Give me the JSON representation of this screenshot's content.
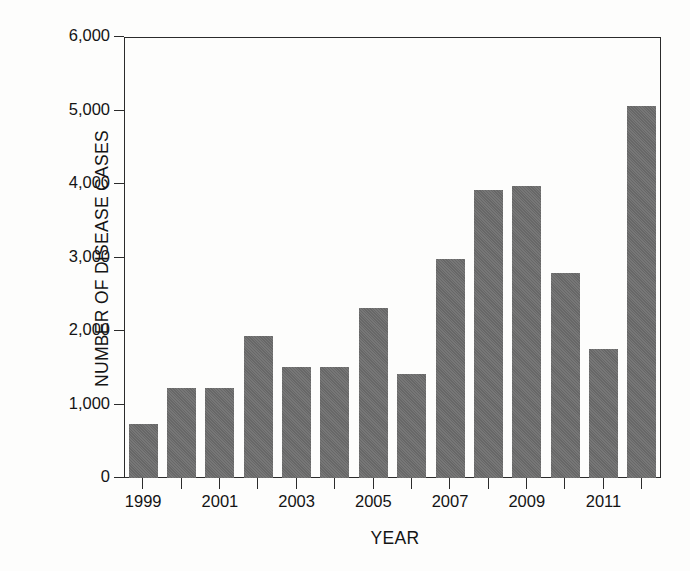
{
  "chart_data": {
    "type": "bar",
    "title": "",
    "xlabel": "YEAR",
    "ylabel": "NUMBER OF DISEASE CASES",
    "categories": [
      "1999",
      "2000",
      "2001",
      "2002",
      "2003",
      "2004",
      "2005",
      "2006",
      "2007",
      "2008",
      "2009",
      "2010",
      "2011",
      "2012"
    ],
    "values": [
      740,
      1220,
      1220,
      1930,
      1510,
      1510,
      2310,
      1410,
      2980,
      3920,
      3970,
      2790,
      1760,
      5060
    ],
    "x_tick_labels": [
      "1999",
      "",
      "2001",
      "",
      "2003",
      "",
      "2005",
      "",
      "2007",
      "",
      "2009",
      "",
      "2011",
      ""
    ],
    "y_tick_labels": [
      "0",
      "1,000",
      "2,000",
      "3,000",
      "4,000",
      "5,000",
      "6,000"
    ],
    "y_tick_values": [
      0,
      1000,
      2000,
      3000,
      4000,
      5000,
      6000
    ],
    "ylim": [
      0,
      6000
    ],
    "grid": false,
    "legend": "none",
    "bar_color": "#6d6d6d",
    "axis_color": "#2b2b2b",
    "background_color": "#fdfdfc"
  }
}
